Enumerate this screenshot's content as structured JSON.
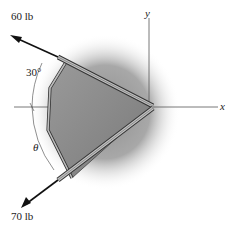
{
  "diagram": {
    "type": "statics force diagram",
    "forces": [
      {
        "label": "60 lb",
        "direction": "upper-left",
        "angle_from_negative_x_deg": 30
      },
      {
        "label": "70 lb",
        "direction": "lower-left",
        "angle_symbol": "θ"
      }
    ],
    "angles": {
      "upper": "30°",
      "lower": "θ"
    },
    "axes": {
      "x": "x",
      "y": "y"
    },
    "colors": {
      "shadow": "#9a9a9a",
      "plate": "#8c8c8c",
      "bar": "#b8b8b8",
      "line": "#333333"
    }
  }
}
